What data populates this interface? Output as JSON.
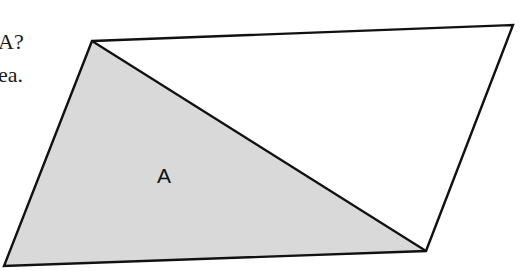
{
  "text_fragments": [
    {
      "id": "line1",
      "text": "A?"
    },
    {
      "id": "line2",
      "text": "ea."
    }
  ],
  "diagram": {
    "shape": "parallelogram",
    "vertices": {
      "top_left": [
        92,
        41
      ],
      "top_right": [
        513,
        25
      ],
      "bottom_right": [
        426,
        251
      ],
      "bottom_left": [
        4,
        266
      ]
    },
    "diagonal": {
      "from": "top_left",
      "to": "bottom_right"
    },
    "shaded_region": {
      "label": "A",
      "vertices": [
        "top_left",
        "bottom_left",
        "bottom_right"
      ],
      "fill": "#d9d9d9"
    },
    "stroke_color": "#111111",
    "label_position": [
      164,
      183
    ]
  }
}
